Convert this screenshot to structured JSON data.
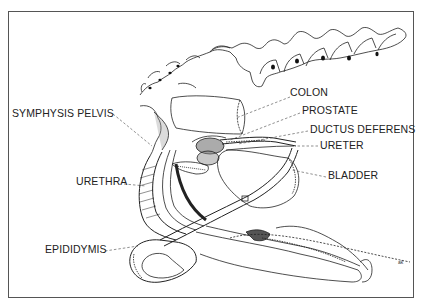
{
  "figure": {
    "type": "anatomical line drawing",
    "signature": "ak",
    "labels": {
      "colon": "COLON",
      "prostate": "PROSTATE",
      "ductus_deferens": "DUCTUS DEFERENS",
      "ureter": "URETER",
      "bladder": "BLADDER",
      "symphysis_pelvis": "SYMPHYSIS PELVIS",
      "urethra": "URETHRA",
      "epididymis": "EPIDIDYMIS"
    }
  }
}
